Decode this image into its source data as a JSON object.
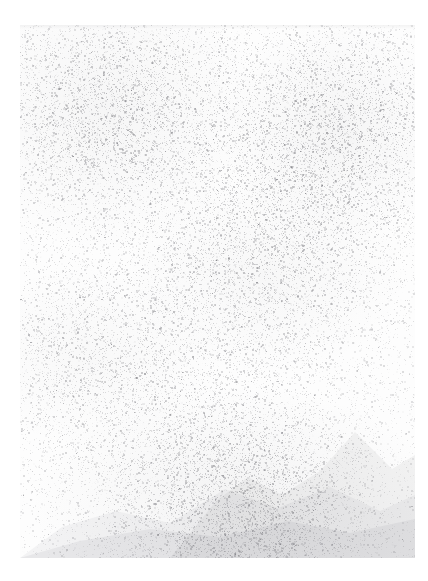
{
  "image": {
    "kind": "faded-scanned-photograph",
    "subject": "mountain landscape",
    "condition": "severely faded, near-blank, heavy grain",
    "legible_text": "",
    "canvas": {
      "width": 428,
      "height": 581
    },
    "background_color": "#ffffff",
    "paper_color": "#fdfdfd",
    "grain_color": "#6e6e74",
    "ridge_color": "#7a7a82",
    "margins": {
      "left": 20,
      "right": 13,
      "top": 25,
      "bottom": 23
    },
    "field": {
      "x": 20,
      "y": 25,
      "width": 395,
      "height": 533
    },
    "tonal_range": {
      "min": 224,
      "max": 255,
      "mean": 251
    },
    "grain": {
      "density": 0.3,
      "max_opacity": 0.34,
      "dot_min_px": 1,
      "dot_max_px": 2,
      "seed": 20250514
    },
    "density_zones": [
      {
        "name": "upper-left-sky",
        "cx": 0.22,
        "cy": 0.16,
        "weight": 1.0
      },
      {
        "name": "upper-right-sky",
        "cx": 0.8,
        "cy": 0.2,
        "weight": 1.05
      },
      {
        "name": "mid-haze",
        "cx": 0.62,
        "cy": 0.47,
        "weight": 0.72
      },
      {
        "name": "left-slope-haze",
        "cx": 0.18,
        "cy": 0.62,
        "weight": 0.62
      },
      {
        "name": "foreground-ridge",
        "cx": 0.55,
        "cy": 0.9,
        "weight": 1.25
      }
    ],
    "ridges": [
      {
        "name": "far-peak-ridge",
        "opacity": 0.085,
        "points": "150,533 196,476 228,452 262,470 300,446 335,407 372,444 395,430 395,533"
      },
      {
        "name": "mid-ridge",
        "opacity": 0.075,
        "points": "0,533 42,502 96,486 150,498 205,464 258,483 310,462 360,486 395,470 395,533 0,533"
      },
      {
        "name": "foreground-ridge",
        "opacity": 0.095,
        "points": "0,533 60,516 130,504 200,512 268,496 330,508 395,494 395,533 0,533"
      }
    ]
  }
}
